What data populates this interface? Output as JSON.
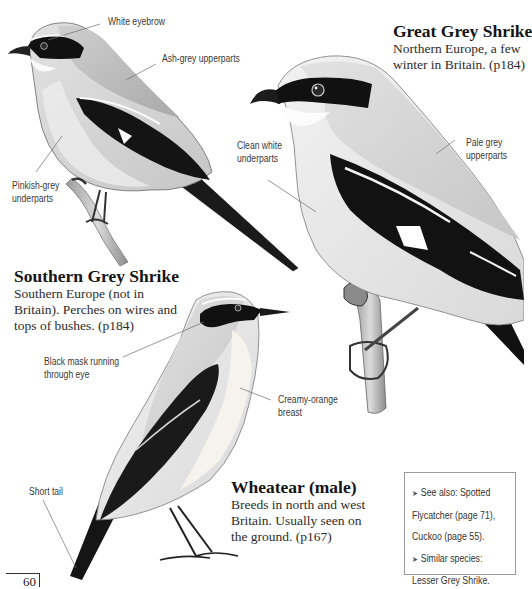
{
  "page": {
    "number": "60",
    "background": "#ffffff"
  },
  "species": [
    {
      "id": "great-grey-shrike",
      "name": "Great Grey Shrike",
      "description": "Northern Europe, a few winter in Britain. (p184)",
      "description_lines": [
        "Northern Europe, a few",
        "winter in Britain. (p184)"
      ]
    },
    {
      "id": "southern-grey-shrike",
      "name": "Southern Grey Shrike",
      "description": "Southern Europe (not in Britain). Perches on wires and tops of bushes. (p184)",
      "description_lines": [
        "Southern Europe (not in",
        "Britain). Perches on wires and",
        "tops of bushes. (p184)"
      ]
    },
    {
      "id": "wheatear-male",
      "name": "Wheatear (male)",
      "description": "Breeds in north and west Britain. Usually seen on the ground. (p167)",
      "description_lines": [
        "Breeds in north and west",
        "Britain. Usually seen on",
        "the ground. (p167)"
      ]
    }
  ],
  "callouts": {
    "white_eyebrow": "White eyebrow",
    "ash_grey_upperparts": "Ash-grey upperparts",
    "pinkish_grey_underparts": [
      "Pinkish-grey",
      "underparts"
    ],
    "clean_white_underparts": [
      "Clean white",
      "underparts"
    ],
    "pale_grey_upperparts": [
      "Pale grey",
      "upperparts"
    ],
    "black_mask": [
      "Black mask running",
      "through eye"
    ],
    "creamy_orange_breast": [
      "Creamy-orange",
      "breast"
    ],
    "short_tail": "Short tail"
  },
  "infobox": {
    "bullet_icon": "arrowhead-bullet",
    "lines": [
      "See also: Spotted",
      "Flycatcher (page 71),",
      "Cuckoo (page 55).",
      "Similar species:",
      "Lesser Grey Shrike."
    ],
    "border_color": "#9a9a9a"
  },
  "illustrations": [
    {
      "name": "southern-grey-shrike-illustration",
      "subject": "Southern Grey Shrike perched on twig"
    },
    {
      "name": "great-grey-shrike-illustration",
      "subject": "Great Grey Shrike perched on post"
    },
    {
      "name": "wheatear-illustration",
      "subject": "Male Wheatear standing"
    }
  ]
}
